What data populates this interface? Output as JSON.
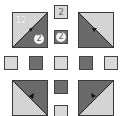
{
  "colors": {
    "light": "#d9d9d9",
    "dark": "#6e6e6e",
    "border": "#3a3a3a",
    "arrow": "#111111"
  },
  "tiles": {
    "top_left": {
      "label": "12",
      "badge": "2",
      "split": "light-upper-left"
    },
    "top_right": {
      "split": "light-upper-right"
    },
    "bottom_left": {
      "split": "light-lower-left"
    },
    "bottom_right": {
      "split": "light-lower-right"
    }
  },
  "top_column": [
    {
      "shade": "light",
      "value": "2"
    },
    {
      "shade": "dark",
      "value": "2"
    }
  ],
  "middle_row": [
    {
      "shade": "light"
    },
    {
      "shade": "dark"
    },
    {
      "shade": "light"
    },
    {
      "shade": "dark"
    },
    {
      "shade": "light"
    }
  ],
  "bottom_column": [
    {
      "shade": "dark"
    },
    {
      "shade": "light"
    }
  ]
}
